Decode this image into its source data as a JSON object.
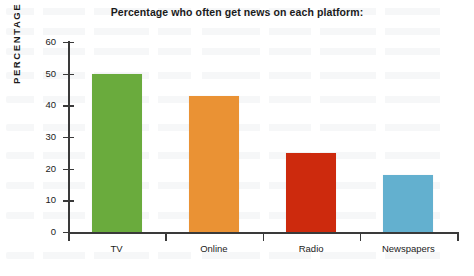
{
  "chart_data": {
    "type": "bar",
    "title": "Percentage who often get news on each platform:",
    "xlabel": "",
    "ylabel": "PERCENTAGE",
    "categories": [
      "TV",
      "Online",
      "Radio",
      "Newspapers"
    ],
    "values": [
      50,
      43,
      25,
      18
    ],
    "series": [
      {
        "name": "Percentage who often get news on each platform",
        "values": [
          50,
          43,
          25,
          18
        ]
      }
    ],
    "colors": [
      "#6aab3d",
      "#ea9234",
      "#cd2a0d",
      "#63b0cf"
    ],
    "ylim": [
      0,
      60
    ],
    "yticks": [
      0,
      10,
      20,
      30,
      40,
      50,
      60
    ],
    "ytick_labels": [
      "0",
      "10",
      "20",
      "30",
      "40",
      "50",
      "60"
    ],
    "grid": false,
    "legend": "none"
  },
  "axis": {
    "axis_color": "#3a3a3a",
    "text_color": "#1b1b1b"
  }
}
